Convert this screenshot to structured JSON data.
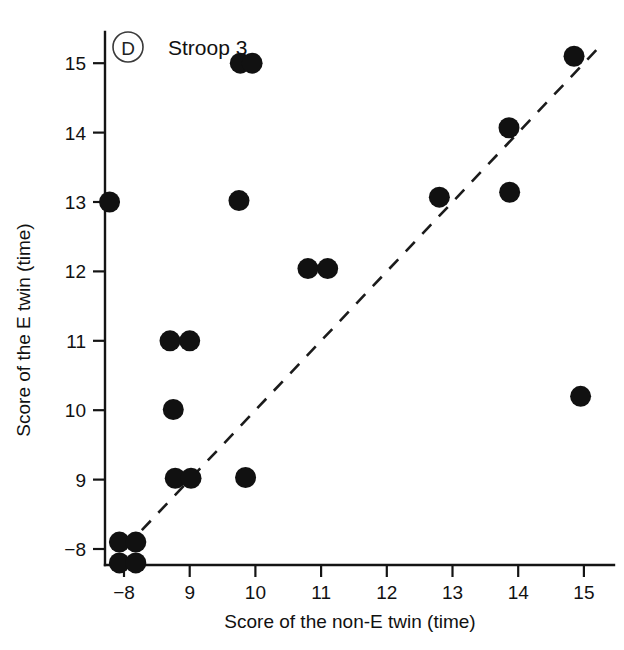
{
  "figure": {
    "panel_label": "D",
    "title": "Stroop 3",
    "background_color": "#ffffff",
    "point_color": "#111111",
    "axis_color": "#141414",
    "reference_line_color": "#1b1b1b"
  },
  "chart_data": {
    "type": "scatter",
    "title": "Stroop 3",
    "panel": "D",
    "xlabel": "Score of the non-E twin (time)",
    "ylabel": "Score of the E twin (time)",
    "xlim": [
      7.75,
      15.45
    ],
    "ylim": [
      7.72,
      15.45
    ],
    "grid": false,
    "legend": null,
    "xticks": [
      8,
      9,
      10,
      11,
      12,
      13,
      14,
      15
    ],
    "xticklabels": [
      "−8",
      "9",
      "10",
      "11",
      "12",
      "13",
      "14",
      "15"
    ],
    "yticks": [
      8,
      9,
      10,
      11,
      12,
      13,
      14,
      15
    ],
    "yticklabels": [
      "−8",
      "9",
      "10",
      "11",
      "12",
      "13",
      "14",
      "15"
    ],
    "annotations": [
      {
        "kind": "reference-line",
        "style": "dashed",
        "description": "identity line y = x",
        "x": [
          8.02,
          15.28
        ],
        "y": [
          8.02,
          15.28
        ]
      }
    ],
    "points": [
      {
        "x": 7.78,
        "y": 13.0
      },
      {
        "x": 9.77,
        "y": 15.0
      },
      {
        "x": 9.95,
        "y": 15.0
      },
      {
        "x": 14.85,
        "y": 15.1
      },
      {
        "x": 13.86,
        "y": 14.07
      },
      {
        "x": 9.75,
        "y": 13.02
      },
      {
        "x": 12.8,
        "y": 13.07
      },
      {
        "x": 13.87,
        "y": 13.14
      },
      {
        "x": 10.8,
        "y": 12.04
      },
      {
        "x": 11.1,
        "y": 12.04
      },
      {
        "x": 8.7,
        "y": 11.0
      },
      {
        "x": 9.0,
        "y": 11.0
      },
      {
        "x": 14.95,
        "y": 10.2
      },
      {
        "x": 8.75,
        "y": 10.01
      },
      {
        "x": 8.78,
        "y": 9.02
      },
      {
        "x": 9.02,
        "y": 9.02
      },
      {
        "x": 9.85,
        "y": 9.03
      },
      {
        "x": 7.93,
        "y": 8.1
      },
      {
        "x": 8.18,
        "y": 8.1
      },
      {
        "x": 7.93,
        "y": 7.8
      },
      {
        "x": 8.18,
        "y": 7.8
      }
    ]
  }
}
